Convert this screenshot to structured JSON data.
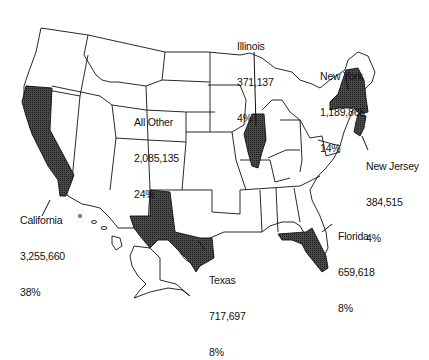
{
  "map": {
    "type": "us-state-choropleth",
    "highlight_fill": "#3a3a3a",
    "base_fill": "#ffffff",
    "stroke": "#111111"
  },
  "labels": [
    {
      "id": "all-other",
      "name": "All Other",
      "value": "2,085,135",
      "pct": "24%"
    },
    {
      "id": "illinois",
      "name": "Illinois",
      "value": "371,137",
      "pct": "4%"
    },
    {
      "id": "new-york",
      "name": "New York",
      "value": "1,189,865",
      "pct": "14%"
    },
    {
      "id": "new-jersey",
      "name": "New Jersey",
      "value": "384,515",
      "pct": "4%"
    },
    {
      "id": "california",
      "name": "California",
      "value": "3,255,660",
      "pct": "38%"
    },
    {
      "id": "texas",
      "name": "Texas",
      "value": "717,697",
      "pct": "8%"
    },
    {
      "id": "florida",
      "name": "Florida",
      "value": "659,618",
      "pct": "8%"
    }
  ]
}
